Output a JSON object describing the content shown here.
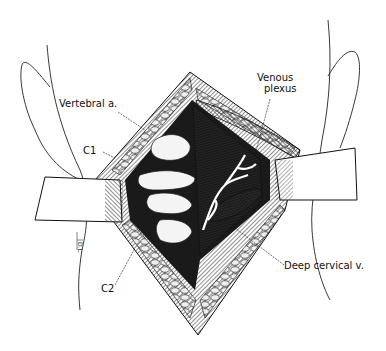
{
  "figure": {
    "type": "surgical anatomical illustration",
    "colors": {
      "ink": "#111111",
      "background": "#ffffff",
      "shade": "#444444"
    }
  },
  "labels": {
    "vertebral_artery": "Vertebral a.",
    "c1": "C1",
    "c2": "C2",
    "venous_plexus_line1": "Venous",
    "venous_plexus_line2": "plexus",
    "deep_cervical_vein": "Deep cervical v."
  },
  "signature": "D.L."
}
